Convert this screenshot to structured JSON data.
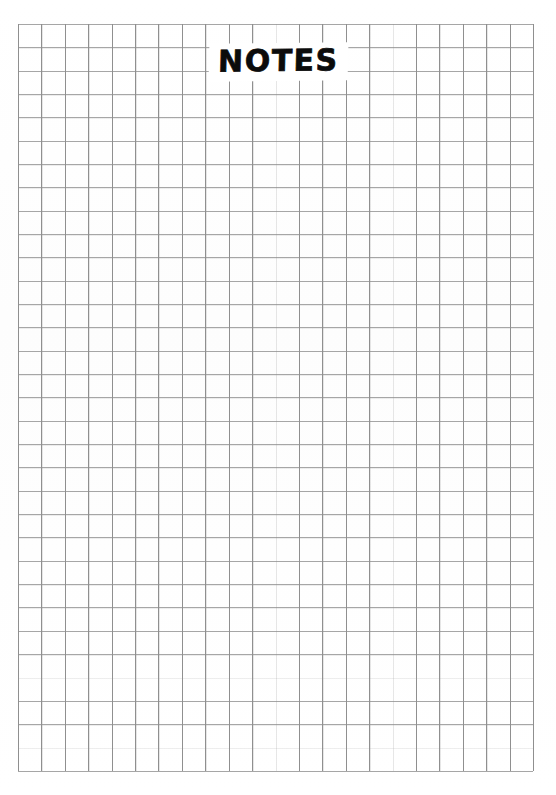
{
  "page": {
    "kind": "grid-paper-sheet",
    "width_px": 556,
    "height_px": 795,
    "background_color": "#fefefe"
  },
  "title": {
    "text": "NOTES",
    "color": "#0b0b0b",
    "style": "bold-handwritten-caps"
  },
  "grid": {
    "columns": 22,
    "rows": 32,
    "cell_width_px": 23.41,
    "cell_height_px": 23.34,
    "origin_x_px": 18,
    "origin_y_px": 24,
    "width_px": 515,
    "height_px": 747,
    "vertical_line_color": "#8f8f8f",
    "horizontal_line_color": "#a6a6a6",
    "line_width_px": 1
  }
}
